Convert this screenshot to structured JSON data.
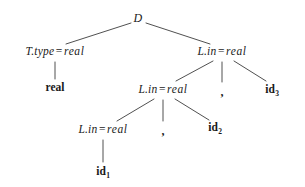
{
  "figure": {
    "kind": "annotated-parse-tree",
    "background_color": "#ffffff",
    "ink_color": "#1a1a1a"
  },
  "nodes": [
    {
      "id": "root",
      "label": "D",
      "style": "math",
      "x": 138,
      "y": 18
    },
    {
      "id": "ttype",
      "lhs": "T.type",
      "op": "=",
      "rhs": "real",
      "style": "math",
      "x": 55,
      "y": 52
    },
    {
      "id": "lin1",
      "lhs": "L.in",
      "op": "=",
      "rhs": "real",
      "style": "math",
      "x": 222,
      "y": 52
    },
    {
      "id": "real",
      "label": "real",
      "style": "terminal",
      "x": 55,
      "y": 88
    },
    {
      "id": "lin2",
      "lhs": "L.in",
      "op": "=",
      "rhs": "real",
      "style": "math",
      "x": 163,
      "y": 90
    },
    {
      "id": "comma1",
      "label": ",",
      "style": "comma",
      "x": 222,
      "y": 92
    },
    {
      "id": "id3",
      "label": "id",
      "sub": "3",
      "style": "terminal",
      "x": 272,
      "y": 90
    },
    {
      "id": "lin3",
      "lhs": "L.in",
      "op": "=",
      "rhs": "real",
      "style": "math",
      "x": 103,
      "y": 130
    },
    {
      "id": "comma2",
      "label": ",",
      "style": "comma",
      "x": 163,
      "y": 131
    },
    {
      "id": "id2",
      "label": "id",
      "sub": "2",
      "style": "terminal",
      "x": 215,
      "y": 128
    },
    {
      "id": "id1",
      "label": "id",
      "sub": "1",
      "style": "terminal",
      "x": 103,
      "y": 172
    }
  ],
  "edges": [
    {
      "from": "root",
      "to": "ttype",
      "x1": 131,
      "y1": 23,
      "x2": 66,
      "y2": 44
    },
    {
      "from": "root",
      "to": "lin1",
      "x1": 146,
      "y1": 23,
      "x2": 210,
      "y2": 44
    },
    {
      "from": "ttype",
      "to": "real",
      "x1": 55,
      "y1": 62,
      "x2": 55,
      "y2": 79
    },
    {
      "from": "lin1",
      "to": "lin2",
      "x1": 213,
      "y1": 61,
      "x2": 176,
      "y2": 81
    },
    {
      "from": "lin1",
      "to": "comma1",
      "x1": 222,
      "y1": 62,
      "x2": 222,
      "y2": 82
    },
    {
      "from": "lin1",
      "to": "id3",
      "x1": 234,
      "y1": 61,
      "x2": 266,
      "y2": 81
    },
    {
      "from": "lin2",
      "to": "lin3",
      "x1": 154,
      "y1": 99,
      "x2": 117,
      "y2": 121
    },
    {
      "from": "lin2",
      "to": "comma2",
      "x1": 163,
      "y1": 100,
      "x2": 163,
      "y2": 121
    },
    {
      "from": "lin2",
      "to": "id2",
      "x1": 175,
      "y1": 99,
      "x2": 209,
      "y2": 120
    },
    {
      "from": "lin3",
      "to": "id1",
      "x1": 103,
      "y1": 140,
      "x2": 103,
      "y2": 162
    }
  ],
  "stroke": {
    "color": "#3c3c3c",
    "width": 0.9
  }
}
